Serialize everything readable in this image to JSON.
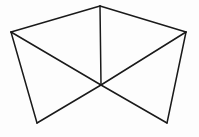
{
  "figure": {
    "canvas": {
      "width": 199,
      "height": 137,
      "background_color": "#fdfdfd"
    },
    "style": {
      "stroke_color": "#1a1a1a",
      "stroke_width": 1.5,
      "fill": "none"
    },
    "vertices": [
      {
        "id": "left",
        "label": "left-vertex",
        "x": 11,
        "y": 32
      },
      {
        "id": "top",
        "label": "top-vertex",
        "x": 100,
        "y": 6
      },
      {
        "id": "right",
        "label": "right-vertex",
        "x": 186,
        "y": 32
      },
      {
        "id": "center",
        "label": "center-vertex",
        "x": 101,
        "y": 85
      },
      {
        "id": "bottom_left",
        "label": "bottom-left-vertex",
        "x": 37,
        "y": 123
      },
      {
        "id": "bottom_right",
        "label": "bottom-right-vertex",
        "x": 167,
        "y": 123
      }
    ],
    "edges": [
      {
        "id": "edge-left-top",
        "from": "left",
        "to": "top",
        "path": "M 11 32 L 100 6"
      },
      {
        "id": "edge-top-right",
        "from": "top",
        "to": "right",
        "path": "M 100 6 L 186 32"
      },
      {
        "id": "edge-left-center",
        "from": "left",
        "to": "center",
        "path": "M 11 32 L 101 85"
      },
      {
        "id": "edge-right-center",
        "from": "right",
        "to": "center",
        "path": "M 186 32 L 101 85"
      },
      {
        "id": "edge-top-center",
        "from": "top",
        "to": "center",
        "path": "M 100 6 L 101 85"
      },
      {
        "id": "edge-left-bottomleft",
        "from": "left",
        "to": "bottom_left",
        "path": "M 11 32 L 37 123"
      },
      {
        "id": "edge-bottomleft-center",
        "from": "bottom_left",
        "to": "center",
        "path": "M 37 123 L 101 85"
      },
      {
        "id": "edge-center-bottomright",
        "from": "center",
        "to": "bottom_right",
        "path": "M 101 85 L 167 123"
      },
      {
        "id": "edge-bottomright-right",
        "from": "bottom_right",
        "to": "right",
        "path": "M 167 123 L 186 32"
      }
    ]
  }
}
